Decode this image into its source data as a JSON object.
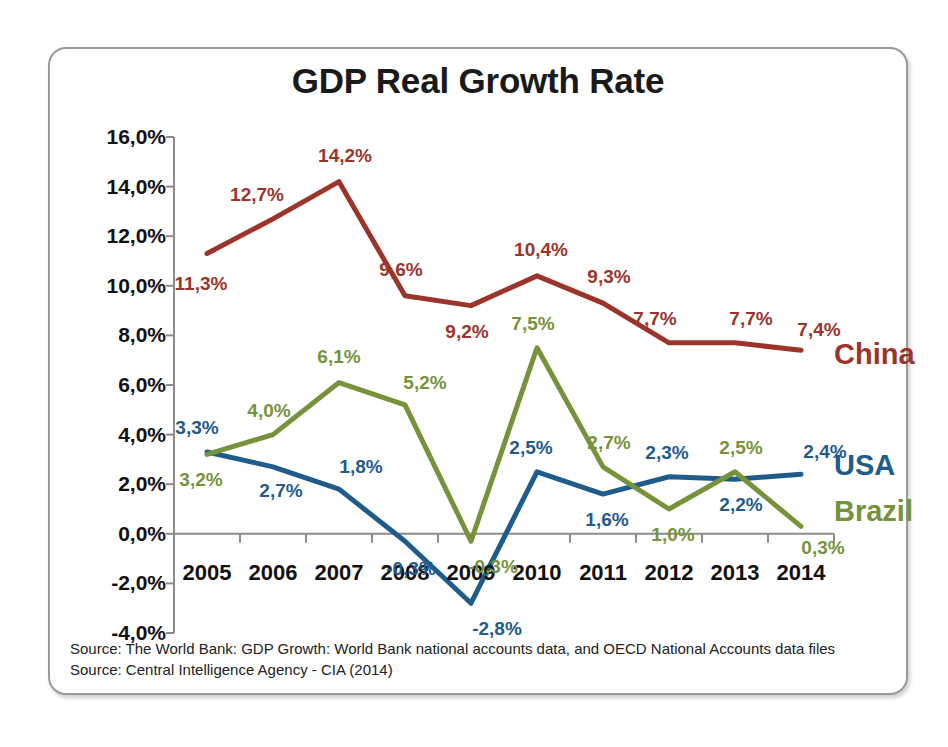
{
  "chart_data": {
    "type": "line",
    "title": "GDP Real Growth Rate",
    "xlabel": "",
    "ylabel": "",
    "categories": [
      "2005",
      "2006",
      "2007",
      "2008",
      "2009",
      "2010",
      "2011",
      "2012",
      "2013",
      "2014"
    ],
    "ylim": [
      -4,
      16
    ],
    "ytick_step": 2,
    "ytick_labels": [
      "16,0%",
      "14,0%",
      "12,0%",
      "10,0%",
      "8,0%",
      "6,0%",
      "4,0%",
      "2,0%",
      "0,0%",
      "-2,0%",
      "-4,0%"
    ],
    "ytick_values": [
      16,
      14,
      12,
      10,
      8,
      6,
      4,
      2,
      0,
      -2,
      -4
    ],
    "grid": false,
    "legend_position": "right-inline",
    "series": [
      {
        "name": "China",
        "color": "#9C342B",
        "values": [
          11.3,
          12.7,
          14.2,
          9.6,
          9.2,
          10.4,
          9.3,
          7.7,
          7.7,
          7.4
        ],
        "labels": [
          "11,3%",
          "12,7%",
          "14,2%",
          "9,6%",
          "9,2%",
          "10,4%",
          "9,3%",
          "7,7%",
          "7,7%",
          "7,4%"
        ]
      },
      {
        "name": "USA",
        "color": "#1F5C8B",
        "values": [
          3.3,
          2.7,
          1.8,
          -0.3,
          -2.8,
          2.5,
          1.6,
          2.3,
          2.2,
          2.4
        ],
        "labels": [
          "3,3%",
          "2,7%",
          "1,8%",
          "-0,3%",
          "-2,8%",
          "2,5%",
          "1,6%",
          "2,3%",
          "2,2%",
          "2,4%"
        ]
      },
      {
        "name": "Brazil",
        "color": "#76933C",
        "values": [
          3.2,
          4.0,
          6.1,
          5.2,
          -0.3,
          7.5,
          2.7,
          1.0,
          2.5,
          0.3
        ],
        "labels": [
          "3,2%",
          "4,0%",
          "6,1%",
          "5,2%",
          "-0,3%",
          "7,5%",
          "2,7%",
          "1,0%",
          "2,5%",
          "0,3%"
        ]
      }
    ]
  },
  "legend": {
    "china": "China",
    "usa": "USA",
    "brazil": "Brazil"
  },
  "footer": {
    "line1": "Source: The World Bank: GDP Growth: World Bank national accounts data, and OECD National Accounts data files",
    "line2": "Source: Central Intelligence Agency - CIA (2014)"
  },
  "colors": {
    "china": "#9C342B",
    "usa": "#1F5C8B",
    "brazil": "#76933C",
    "axis": "#8c8c8c",
    "border": "#9a9a9a",
    "title": "#1a1a1a"
  }
}
